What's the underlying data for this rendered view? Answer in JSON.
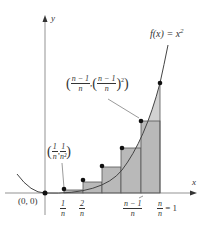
{
  "diagram": {
    "axes": {
      "x_label": "x",
      "y_label": "y"
    },
    "function_label": {
      "f": "f(x) = x",
      "exp": "2"
    },
    "origin_label": "(0, 0)",
    "point_labels": {
      "first": {
        "x_num": "1",
        "x_den": "n",
        "y_num": "1",
        "y_den": "n²",
        "sep": ","
      },
      "last": {
        "x_num": "n − 1",
        "x_den": "n",
        "y_num": "n − 1",
        "y_den": "n",
        "exp": "2",
        "sep": ","
      }
    },
    "tick_labels": [
      {
        "num": "1",
        "den": "n"
      },
      {
        "num": "2",
        "den": "n"
      },
      {
        "num": "n − 1",
        "den": "n"
      },
      {
        "num": "n",
        "den": "n",
        "suffix": "= 1"
      }
    ],
    "colors": {
      "axis": "#555555",
      "curve": "#444444",
      "rect_fill": "#b9b9b9",
      "excess_fill": "#d2d2d2",
      "rect_stroke": "#555555",
      "dot": "#111111"
    },
    "geometry": {
      "origin_px": [
        45,
        193
      ],
      "unit_px": 115,
      "height_scale_px": 110,
      "n_visible_rectangles": 6
    }
  }
}
